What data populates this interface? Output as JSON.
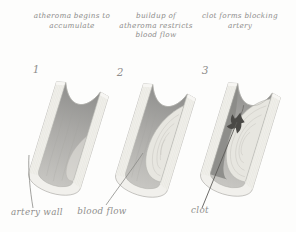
{
  "diagram": {
    "stages": [
      {
        "number": "1",
        "caption_lines": [
          "atheroma begins to",
          "accumulate"
        ]
      },
      {
        "number": "2",
        "caption_lines": [
          "buildup of",
          "atheroma restricts",
          "blood flow"
        ]
      },
      {
        "number": "3",
        "caption_lines": [
          "clot forms blocking",
          "artery"
        ]
      }
    ],
    "part_labels": {
      "artery_wall": "artery wall",
      "blood_flow": "blood flow",
      "clot": "clot"
    }
  },
  "colors": {
    "background": "#fdfdfc",
    "text": "#8f8e8c",
    "wall": "#f1f0ec",
    "wall_line": "#dcdbd4",
    "wall_edge": "#b5b4af",
    "lumen_top": "#8e8e8c",
    "lumen_mid": "#abaaa7",
    "lumen_bottom": "#c7c6c2",
    "atheroma": "#e7e6e0",
    "atheroma_line": "#c7c6bf",
    "clot": "#4a4946",
    "leader": "#8a8a87",
    "leader_dark": "#5c5b58"
  }
}
